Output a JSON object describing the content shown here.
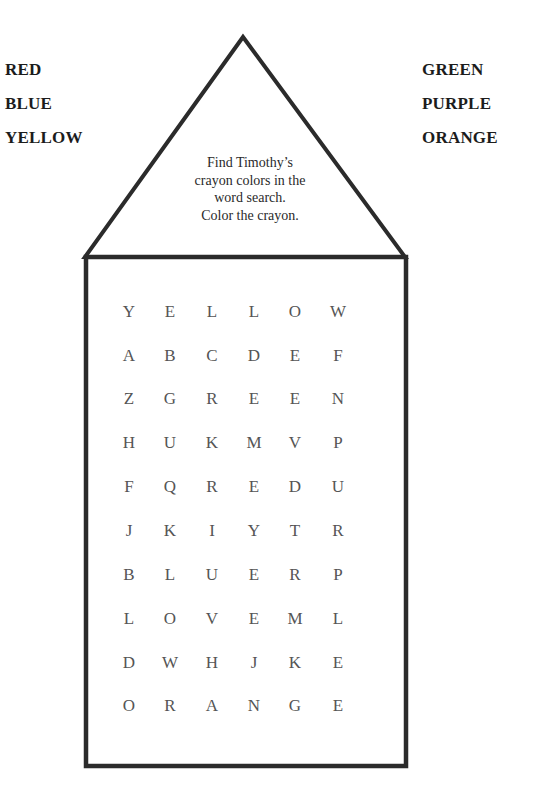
{
  "word_bank": {
    "left": [
      "RED",
      "BLUE",
      "YELLOW"
    ],
    "right": [
      "GREEN",
      "PURPLE",
      "ORANGE"
    ]
  },
  "instructions": {
    "lines": [
      "Find Timothy’s",
      "crayon colors in the",
      "word search.",
      "Color the crayon."
    ]
  },
  "word_search": {
    "rows": [
      [
        "Y",
        "E",
        "L",
        "L",
        "O",
        "W"
      ],
      [
        "A",
        "B",
        "C",
        "D",
        "E",
        "F"
      ],
      [
        "Z",
        "G",
        "R",
        "E",
        "E",
        "N"
      ],
      [
        "H",
        "U",
        "K",
        "M",
        "V",
        "P"
      ],
      [
        "F",
        "Q",
        "R",
        "E",
        "D",
        "U"
      ],
      [
        "J",
        "K",
        "I",
        "Y",
        "T",
        "R"
      ],
      [
        "B",
        "L",
        "U",
        "E",
        "R",
        "P"
      ],
      [
        "L",
        "O",
        "V",
        "E",
        "M",
        "L"
      ],
      [
        "D",
        "W",
        "H",
        "J",
        "K",
        "E"
      ],
      [
        "O",
        "R",
        "A",
        "N",
        "G",
        "E"
      ]
    ]
  },
  "colors": {
    "outline": "#2b2b2b",
    "grid_letter": "#555555",
    "word_bank_text": "#1c1c1c"
  }
}
